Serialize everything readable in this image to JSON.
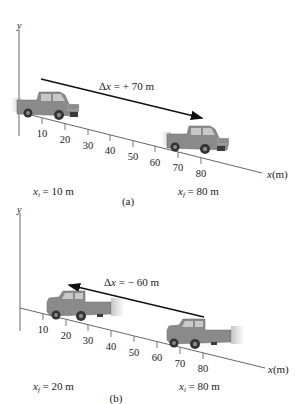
{
  "panels": [
    {
      "id": "a",
      "caption": "(a)",
      "y_axis_label": "y",
      "x_axis_label": "x (m)",
      "x_axis_var": "x",
      "x_axis_unit": "(m)",
      "ticks": [
        "10",
        "20",
        "30",
        "40",
        "50",
        "60",
        "70",
        "80"
      ],
      "displacement": {
        "prefix": "Δ",
        "var": "x",
        "value": "= + 70 m"
      },
      "arrow_direction": "right",
      "initial": {
        "var": "x",
        "sub": "i",
        "value": "= 10 m"
      },
      "final": {
        "var": "x",
        "sub": "f",
        "value": "= 80 m"
      },
      "truck_start_position_m": 10,
      "truck_end_position_m": 80
    },
    {
      "id": "b",
      "caption": "(b)",
      "y_axis_label": "y",
      "x_axis_label": "x (m)",
      "x_axis_var": "x",
      "x_axis_unit": "(m)",
      "ticks": [
        "10",
        "20",
        "30",
        "40",
        "50",
        "60",
        "70",
        "80"
      ],
      "displacement": {
        "prefix": "Δ",
        "var": "x",
        "value": "= − 60 m"
      },
      "arrow_direction": "left",
      "initial": {
        "var": "x",
        "sub": "i",
        "value": "= 80 m"
      },
      "final": {
        "var": "x",
        "sub": "f",
        "value": "= 20 m"
      },
      "truck_start_position_m": 80,
      "truck_end_position_m": 20
    }
  ],
  "colors": {
    "axis": "#555555",
    "arrow": "#111111",
    "truck_body": "#8a8a8a",
    "truck_dark": "#3a3a3a",
    "text": "#222222"
  }
}
